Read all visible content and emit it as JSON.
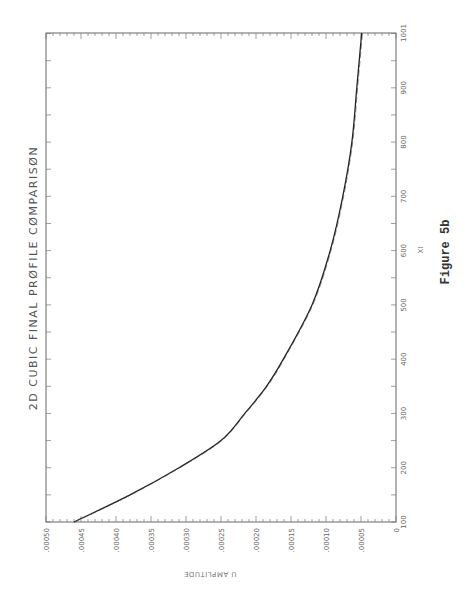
{
  "figure": {
    "caption": "Figure 5b",
    "orientation": "rotated 90 degrees counter-clockwise"
  },
  "chart_data": {
    "type": "line",
    "title": "2D CUBIC FINAL PRØFILE CØMPARISØN",
    "xlabel": "XI",
    "ylabel": "U AMPLITUDE",
    "xlim": [
      100,
      1001
    ],
    "ylim": [
      0,
      0.0005
    ],
    "x_ticks": [
      "100",
      "200",
      "300",
      "400",
      "500",
      "600",
      "700",
      "800",
      "900",
      "1001"
    ],
    "y_ticks": [
      "0",
      ".00005",
      ".00010",
      ".00015",
      ".00020",
      ".00025",
      ".00030",
      ".00035",
      ".00040",
      ".00045",
      ".00050"
    ],
    "grid": false,
    "legend": null,
    "series": [
      {
        "name": "final profile (two overlapping curves)",
        "x": [
          100,
          150,
          200,
          250,
          300,
          350,
          400,
          500,
          600,
          700,
          800,
          900,
          1001
        ],
        "values": [
          0.00046,
          0.00038,
          0.00031,
          0.00025,
          0.000216,
          0.000185,
          0.000161,
          0.00012,
          9.4e-05,
          7.6e-05,
          6.3e-05,
          5.6e-05,
          4.9e-05
        ]
      }
    ]
  }
}
